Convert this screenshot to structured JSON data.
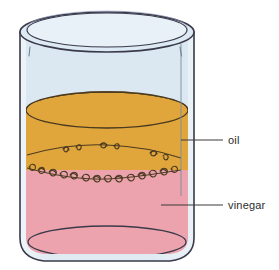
{
  "diagram": {
    "type": "science-illustration",
    "background_color": "#ffffff"
  },
  "beaker": {
    "name": "beaker",
    "glass_fill": "#dfeaf2",
    "glass_highlight": "#eef5fa",
    "outline_color": "#3a3a4a",
    "rim_fill": "#dde9f3",
    "wall_line_color": "#5b6b7c"
  },
  "layers": [
    {
      "id": "air",
      "label": "",
      "color": "#dfeaf2",
      "position": "top"
    },
    {
      "id": "oil",
      "label": "oil",
      "color": "#e0a63c",
      "surface_color": "#c98f2c",
      "position": "middle"
    },
    {
      "id": "vinegar",
      "label": "vinegar",
      "color": "#eca3ad",
      "surface_color": "#e08f9c",
      "position": "bottom"
    }
  ],
  "interface": {
    "name": "emulsion-boundary",
    "description": "squiggly curled droplet marks between oil and vinegar",
    "line_color": "#4a3a20"
  },
  "labels": {
    "oil": {
      "text": "oil",
      "color": "#2b2b2b",
      "leader_from_x": 181,
      "leader_to_x": 222,
      "leader_y": 140
    },
    "vinegar": {
      "text": "vinegar",
      "color": "#2b2b2b",
      "leader_from_x": 161,
      "leader_to_x": 222,
      "leader_y": 205
    }
  },
  "leader_line_color": "#3a3a3a"
}
